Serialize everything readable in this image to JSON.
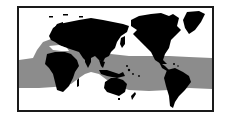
{
  "figure": {
    "type": "world-map",
    "projection": "Eurasia-Africa left, Americas right, Pacific in center",
    "legend": null,
    "title": null
  },
  "colors": {
    "background": "#ffffff",
    "frame": "#1a1a1a",
    "land": "#000000",
    "range_band": "#8c8c8c",
    "ocean": "#ffffff"
  },
  "regions": {
    "range_band": {
      "label": "tropical/subtropical distribution band",
      "description": "Gray band spanning roughly tropics across Atlantic, Indian and Pacific Oceans"
    },
    "continents": [
      "Europe",
      "Asia",
      "Africa",
      "Australia",
      "North America",
      "South America",
      "Greenland"
    ]
  }
}
